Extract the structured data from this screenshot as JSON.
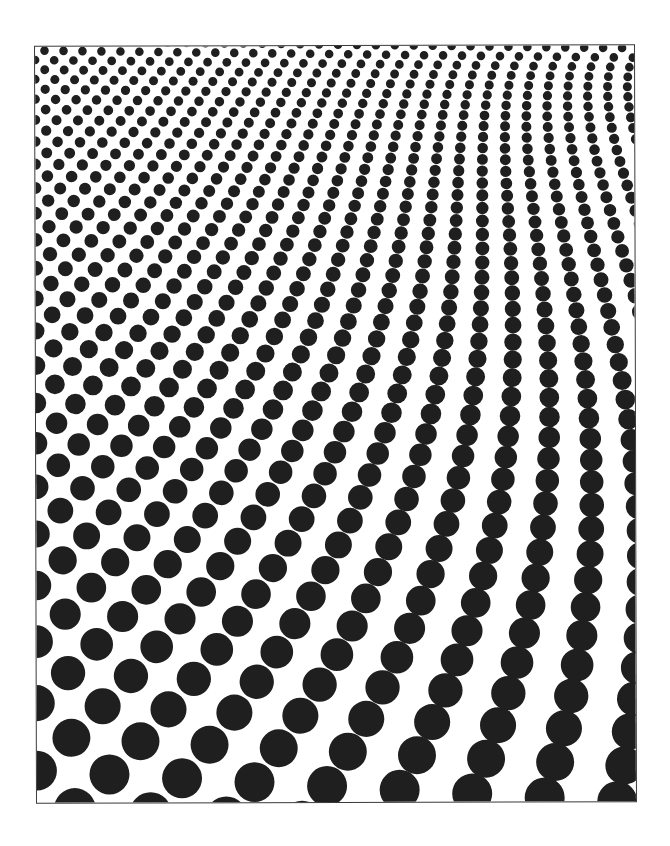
{
  "page": {
    "background": "#ffffff"
  },
  "pattern": {
    "name": "halftone-dot-gradient",
    "dot_color": "#1f1f1f",
    "border_color": "#3a3a3a",
    "frame": {
      "width": 601,
      "height": 758
    },
    "grid_angle_deg": -27,
    "spacing_top": 19,
    "spacing_bottom": 76,
    "radius_top": 4.3,
    "radius_bottom": 21
  }
}
